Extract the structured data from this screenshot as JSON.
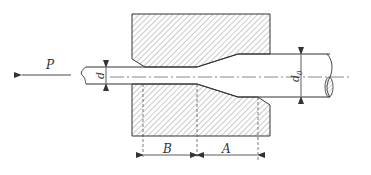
{
  "diagram": {
    "type": "wire-drawing-die-cross-section",
    "labels": {
      "force": "P",
      "drawn_diameter": "d",
      "initial_diameter": "d",
      "initial_diameter_subscript": "0",
      "bearing_length": "B",
      "approach_length": "A"
    },
    "colors": {
      "line": "#333333",
      "hatch": "#555555",
      "background": "#ffffff"
    }
  }
}
